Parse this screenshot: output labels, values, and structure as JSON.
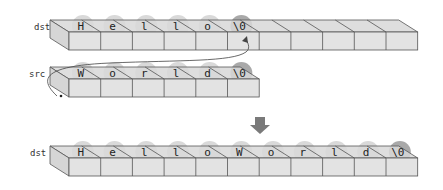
{
  "colors": {
    "front_face": "#e3e3e3",
    "top_face": "#d8d8d8",
    "side_face": "#d6d6d6",
    "edge": "#555555",
    "bubble": "#d9d9d9",
    "null_bubble": "#a9a9a9",
    "arrow": "#7a7a7a",
    "curve": "#444444",
    "text": "#222222"
  },
  "rows": [
    {
      "id": "dst-before",
      "label": "dst",
      "cell_count": 11,
      "chars": [
        "H",
        "e",
        "l",
        "l",
        "o",
        "\\0"
      ],
      "null_index": 5
    },
    {
      "id": "src",
      "label": "src",
      "cell_count": 6,
      "chars": [
        "W",
        "o",
        "r",
        "l",
        "d",
        "\\0"
      ],
      "null_index": 5
    },
    {
      "id": "dst-after",
      "label": "dst",
      "cell_count": 11,
      "chars": [
        "H",
        "e",
        "l",
        "l",
        "o",
        "W",
        "o",
        "r",
        "l",
        "d",
        "\\0"
      ],
      "null_index": 10
    }
  ],
  "annotations": {
    "copy_curve": "src copied onto dst starting at dst's terminating \\0",
    "result_arrow": "down-arrow"
  }
}
